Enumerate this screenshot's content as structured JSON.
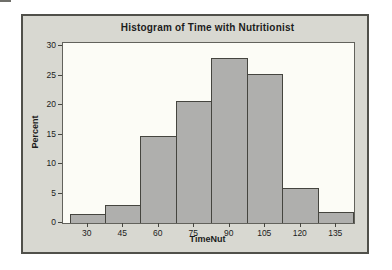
{
  "figure": {
    "title": "Histogram of Time with Nutritionist",
    "x_axis_title": "TimeNut",
    "y_axis_title": "Percent"
  },
  "chart_data": {
    "type": "bar",
    "subtype": "histogram",
    "title": "Histogram of Time with Nutritionist",
    "xlabel": "TimeNut",
    "ylabel": "Percent",
    "categories": [
      30,
      45,
      60,
      75,
      90,
      105,
      120,
      135
    ],
    "values": [
      1.5,
      3,
      14.7,
      20.7,
      28,
      25.2,
      6,
      1.8
    ],
    "bin_width": 15,
    "x_ticks": [
      30,
      45,
      60,
      75,
      90,
      105,
      120,
      135
    ],
    "y_ticks": [
      0,
      5,
      10,
      15,
      20,
      25,
      30
    ],
    "ylim": [
      0,
      30.5
    ],
    "grid": false,
    "legend": "none",
    "colors": {
      "bar_fill": "#afafad",
      "bar_border": "#45453f",
      "window_bg": "#d8d8d1",
      "window_border": "#50504a",
      "plot_bg": "#fcfcf6",
      "plot_border": "#62625c",
      "text": "#1c1c1c"
    }
  }
}
